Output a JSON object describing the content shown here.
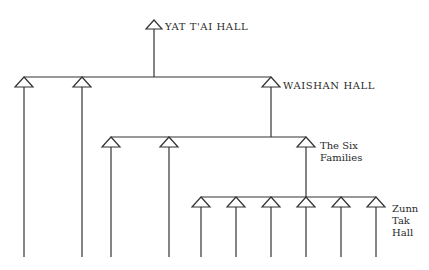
{
  "nodes": {
    "yat_tai": {
      "label": "YAT T'AI HALL"
    },
    "waishan": {
      "label": "WAISHAN HALL"
    },
    "six_families": {
      "label": "The Six\nFamilies"
    },
    "zunn_tak": {
      "label": "Zunn\nTak\nHall"
    }
  },
  "structure": {
    "root": "YAT T'AI HALL",
    "levels": [
      {
        "name": "YAT T'AI HALL",
        "children_count": 3,
        "labelled_child": "WAISHAN HALL"
      },
      {
        "name": "WAISHAN HALL",
        "children_count": 3,
        "labelled_child": "The Six Families"
      },
      {
        "name": "The Six Families",
        "children_count": 6,
        "labelled_group": "Zunn Tak Hall"
      }
    ]
  },
  "colors": {
    "line": "#333333",
    "background": "#ffffff"
  }
}
